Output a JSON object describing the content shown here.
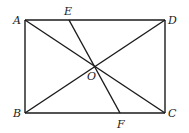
{
  "diagram": {
    "type": "geometry",
    "shape": "rectangle ABCD with diagonals AC and BD intersecting at O; segment EF passes through O",
    "points": {
      "A": {
        "label": "A",
        "x": 25,
        "y": 20,
        "lx": 13,
        "ly": 24
      },
      "B": {
        "label": "B",
        "x": 25,
        "y": 113,
        "lx": 13,
        "ly": 117
      },
      "C": {
        "label": "C",
        "x": 165,
        "y": 113,
        "lx": 168,
        "ly": 117
      },
      "D": {
        "label": "D",
        "x": 165,
        "y": 20,
        "lx": 168,
        "ly": 24
      },
      "E": {
        "label": "E",
        "x": 69,
        "y": 20,
        "lx": 64,
        "ly": 15
      },
      "F": {
        "label": "F",
        "x": 120,
        "y": 113,
        "lx": 117,
        "ly": 128
      },
      "O": {
        "label": "O",
        "x": 95,
        "y": 66,
        "lx": 87,
        "ly": 80
      }
    },
    "segments": [
      [
        "A",
        "D"
      ],
      [
        "D",
        "C"
      ],
      [
        "C",
        "B"
      ],
      [
        "B",
        "A"
      ],
      [
        "A",
        "C"
      ],
      [
        "B",
        "D"
      ],
      [
        "E",
        "F"
      ]
    ]
  }
}
